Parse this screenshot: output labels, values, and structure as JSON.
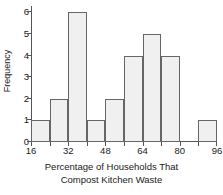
{
  "chart_data": {
    "type": "bar",
    "title": "",
    "xlabel": "Percentage of Households That Compost Kitchen Waste",
    "xlabel_lines": [
      "Percentage of Households That",
      "Compost Kitchen Waste"
    ],
    "ylabel": "Frequency",
    "bin_width": 8,
    "categories": [
      "16-24",
      "24-32",
      "32-40",
      "40-48",
      "48-56",
      "56-64",
      "64-72",
      "72-80",
      "80-88",
      "88-96"
    ],
    "bin_edges": [
      16,
      24,
      32,
      40,
      48,
      56,
      64,
      72,
      80,
      88,
      96
    ],
    "values": [
      1,
      2,
      6,
      1,
      2,
      4,
      5,
      4,
      0,
      1
    ],
    "xlim": [
      16,
      96
    ],
    "ylim": [
      0,
      6.3
    ],
    "xticks_major": [
      16,
      32,
      48,
      64,
      80,
      96
    ],
    "xticks_minor": [
      24,
      40,
      56,
      72,
      88
    ],
    "xtick_labels": [
      "16",
      "32",
      "48",
      "64",
      "80",
      "96"
    ],
    "yticks": [
      0,
      1,
      2,
      3,
      4,
      5,
      6
    ],
    "ytick_labels": [
      "0",
      "1",
      "2",
      "3",
      "4",
      "5",
      "6"
    ],
    "grid": false,
    "legend": false,
    "bar_fill_color": "#f0f0f0",
    "bar_edge_color": "#666666",
    "axis_color": "#555555",
    "text_color": "#1a1a1a",
    "background_color": "#ffffff"
  }
}
